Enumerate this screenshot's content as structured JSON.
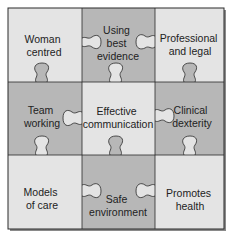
{
  "diagram": {
    "colors": {
      "light": "#e4e4e4",
      "dark": "#b7b7b7",
      "stroke": "#2a2a2a",
      "text": "#222222",
      "shadow": "#8a8a8a"
    },
    "pieces": [
      {
        "id": "woman-centred",
        "row": 0,
        "col": 0,
        "shade": "light",
        "lines": [
          "Woman",
          "centred"
        ]
      },
      {
        "id": "using-best-evidence",
        "row": 0,
        "col": 1,
        "shade": "dark",
        "lines": [
          "Using",
          "best",
          "evidence"
        ]
      },
      {
        "id": "professional-and-legal",
        "row": 0,
        "col": 2,
        "shade": "light",
        "lines": [
          "Professional",
          "and legal"
        ]
      },
      {
        "id": "team-working",
        "row": 1,
        "col": 0,
        "shade": "dark",
        "lines": [
          "Team",
          "working"
        ]
      },
      {
        "id": "effective-communication",
        "row": 1,
        "col": 1,
        "shade": "light",
        "lines": [
          "Effective",
          "communication"
        ]
      },
      {
        "id": "clinical-dexterity",
        "row": 1,
        "col": 2,
        "shade": "dark",
        "lines": [
          "Clinical",
          "dexterity"
        ]
      },
      {
        "id": "models-of-care",
        "row": 2,
        "col": 0,
        "shade": "light",
        "lines": [
          "Models",
          "of care"
        ]
      },
      {
        "id": "safe-environment",
        "row": 2,
        "col": 1,
        "shade": "dark",
        "lines": [
          "Safe",
          "environment"
        ]
      },
      {
        "id": "promotes-health",
        "row": 2,
        "col": 2,
        "shade": "light",
        "lines": [
          "Promotes",
          "health"
        ]
      }
    ]
  }
}
